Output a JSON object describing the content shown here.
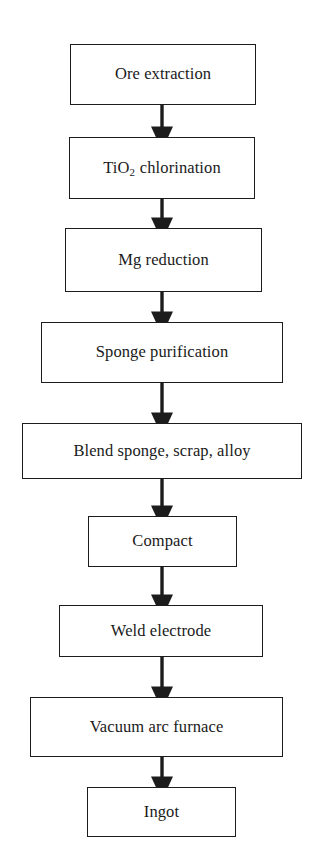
{
  "diagram": {
    "orientation": "vertical-top-down",
    "background_color": "#ffffff",
    "stroke_color": "#1c1c1c",
    "text_color": "#1a1a1a",
    "nodes": [
      {
        "id": "ore-extraction",
        "label": "Ore extraction",
        "label_html": "Ore extraction",
        "x": 70,
        "y": 44,
        "width": 186,
        "height": 61
      },
      {
        "id": "tio2-chlorination",
        "label": "TiO2 chlorination",
        "label_html": "TiO<sub>2</sub> chlorination",
        "x": 69,
        "y": 137,
        "width": 186,
        "height": 62
      },
      {
        "id": "mg-reduction",
        "label": "Mg reduction",
        "label_html": "Mg reduction",
        "x": 65,
        "y": 228,
        "width": 197,
        "height": 64
      },
      {
        "id": "sponge-purification",
        "label": "Sponge purification",
        "label_html": "Sponge purification",
        "x": 41,
        "y": 322,
        "width": 242,
        "height": 61
      },
      {
        "id": "blend-sponge-scrap-alloy",
        "label": "Blend sponge, scrap, alloy",
        "label_html": "Blend sponge, scrap, alloy",
        "x": 22,
        "y": 423,
        "width": 280,
        "height": 56
      },
      {
        "id": "compact",
        "label": "Compact",
        "label_html": "Compact",
        "x": 88,
        "y": 516,
        "width": 149,
        "height": 51
      },
      {
        "id": "weld-electrode",
        "label": "Weld electrode",
        "label_html": "Weld electrode",
        "x": 59,
        "y": 605,
        "width": 204,
        "height": 52
      },
      {
        "id": "vacuum-arc-furnace",
        "label": "Vacuum arc furnace",
        "label_html": "Vacuum arc furnace",
        "x": 30,
        "y": 697,
        "width": 253,
        "height": 60
      },
      {
        "id": "ingot",
        "label": "Ingot",
        "label_html": "Ingot",
        "x": 87,
        "y": 787,
        "width": 149,
        "height": 50
      }
    ],
    "edges": [
      {
        "id": "e1",
        "from": "ore-extraction",
        "to": "tio2-chlorination",
        "x": 162,
        "y1": 105,
        "y2": 137
      },
      {
        "id": "e2",
        "from": "tio2-chlorination",
        "to": "mg-reduction",
        "x": 162,
        "y1": 199,
        "y2": 228
      },
      {
        "id": "e3",
        "from": "mg-reduction",
        "to": "sponge-purification",
        "x": 162,
        "y1": 292,
        "y2": 322
      },
      {
        "id": "e4",
        "from": "sponge-purification",
        "to": "blend-sponge-scrap-alloy",
        "x": 162,
        "y1": 383,
        "y2": 423
      },
      {
        "id": "e5",
        "from": "blend-sponge-scrap-alloy",
        "to": "compact",
        "x": 162,
        "y1": 479,
        "y2": 516
      },
      {
        "id": "e6",
        "from": "compact",
        "to": "weld-electrode",
        "x": 162,
        "y1": 567,
        "y2": 605
      },
      {
        "id": "e7",
        "from": "weld-electrode",
        "to": "vacuum-arc-furnace",
        "x": 162,
        "y1": 657,
        "y2": 697
      },
      {
        "id": "e8",
        "from": "vacuum-arc-furnace",
        "to": "ingot",
        "x": 162,
        "y1": 757,
        "y2": 787
      }
    ]
  }
}
